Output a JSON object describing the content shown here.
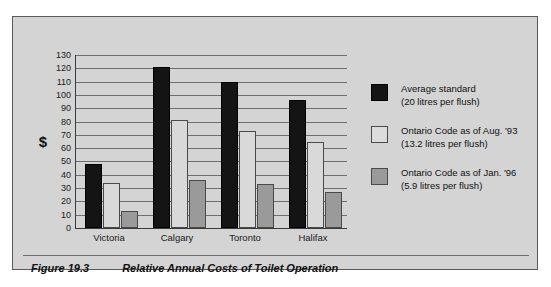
{
  "chart_data": {
    "type": "bar",
    "title": "Relative Annual Costs of Toilet Operation",
    "xlabel": "",
    "ylabel": "$",
    "ylim": [
      0,
      130
    ],
    "ytick_step": 10,
    "yticks": [
      130,
      120,
      110,
      100,
      90,
      80,
      70,
      60,
      50,
      40,
      30,
      20,
      10,
      0
    ],
    "grid": true,
    "legend_position": "right",
    "categories": [
      "Victoria",
      "Calgary",
      "Toronto",
      "Halifax"
    ],
    "series": [
      {
        "name": "Average standard",
        "detail": "(20 litres per flush)",
        "color": "#141414",
        "values": [
          48,
          121,
          110,
          96
        ]
      },
      {
        "name": "Ontario Code as of Aug. '93",
        "detail": "(13.2 litres per flush)",
        "color": "#dcdcdc",
        "values": [
          34,
          81,
          73,
          65
        ]
      },
      {
        "name": "Ontario Code as of Jan. '96",
        "detail": "(5.9 litres per flush)",
        "color": "#9a9a9a",
        "values": [
          13,
          36,
          33,
          27
        ]
      }
    ]
  },
  "caption": {
    "figure_number": "Figure 19.3",
    "title": "Relative Annual Costs of Toilet Operation"
  }
}
